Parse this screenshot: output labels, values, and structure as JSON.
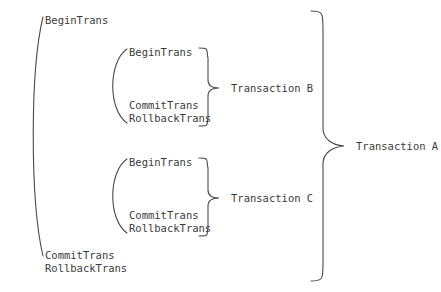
{
  "diagram": {
    "stroke_color": "#4a4a4a",
    "text_color": "#3b3b3b",
    "background_color": "#ffffff",
    "outer_transaction": {
      "begin_label": "BeginTrans",
      "commit_label": "CommitTrans",
      "rollback_label": "RollbackTrans",
      "name": "Transaction A"
    },
    "inner_transactions": [
      {
        "begin_label": "BeginTrans",
        "commit_label": "CommitTrans",
        "rollback_label": "RollbackTrans",
        "name": "Transaction B"
      },
      {
        "begin_label": "BeginTrans",
        "commit_label": "CommitTrans",
        "rollback_label": "RollbackTrans",
        "name": "Transaction C"
      }
    ]
  }
}
